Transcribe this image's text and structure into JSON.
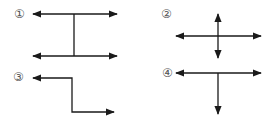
{
  "diagrams": [
    {
      "label": "①",
      "description": "H-shaped: two horizontal double-headed arrows joined by a vertical line"
    },
    {
      "label": "②",
      "description": "Cross of a horizontal and a vertical double-headed arrow"
    },
    {
      "label": "③",
      "description": "Step-shaped path with arrows at both ends pointing left and right"
    },
    {
      "label": "④",
      "description": "T-shape: horizontal double-headed arrow with downward arrow from center"
    }
  ],
  "colors": {
    "stroke": "#1a1a1a",
    "label": "#555555",
    "background": "#ffffff"
  }
}
